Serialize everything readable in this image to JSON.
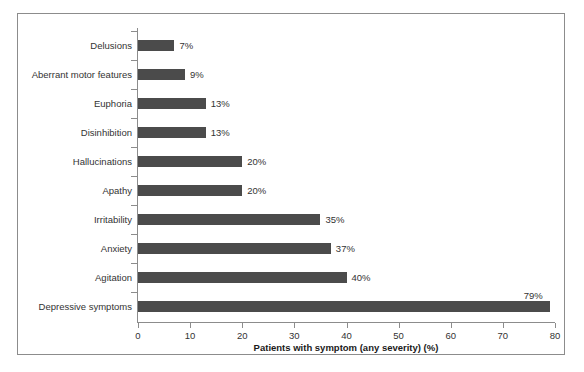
{
  "chart_data": {
    "type": "bar",
    "orientation": "horizontal",
    "title": "",
    "xlabel": "Patients with symptom (any severity) (%)",
    "ylabel": "",
    "xlim": [
      0,
      80
    ],
    "xticks": [
      0,
      10,
      20,
      30,
      40,
      50,
      60,
      70,
      80
    ],
    "xtick_labels": [
      "0",
      "10",
      "20",
      "30",
      "40",
      "50",
      "60",
      "70",
      "80"
    ],
    "grid": false,
    "legend": null,
    "bar_color": "#4b4b4b",
    "categories": [
      "Delusions",
      "Aberrant motor features",
      "Euphoria",
      "Disinhibition",
      "Hallucinations",
      "Apathy",
      "Irritability",
      "Anxiety",
      "Agitation",
      "Depressive symptoms"
    ],
    "values": [
      7,
      9,
      13,
      13,
      20,
      20,
      35,
      37,
      40,
      79
    ],
    "data_labels": [
      "7%",
      "9%",
      "13%",
      "13%",
      "20%",
      "20%",
      "35%",
      "37%",
      "40%",
      "79%"
    ]
  }
}
